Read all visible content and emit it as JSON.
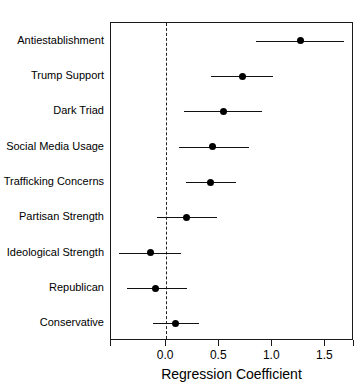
{
  "chart_data": {
    "type": "scatter",
    "subtype": "forest-plot",
    "title": "",
    "xlabel": "Regression Coefficient",
    "ylabel": "",
    "xlim": [
      -0.52,
      1.77
    ],
    "ylim": [
      0,
      9
    ],
    "grid": false,
    "legend": false,
    "reference_line": {
      "value": 0.0,
      "style": "dashed",
      "orientation": "vertical"
    },
    "xticks": [
      0.0,
      0.5,
      1.0,
      1.5
    ],
    "xticklabels": [
      "0.0",
      "0.5",
      "1.0",
      "1.5"
    ],
    "categories": [
      "Antiestablishment",
      "Trump Support",
      "Dark Triad",
      "Social Media Usage",
      "Trafficking Concerns",
      "Partisan Strength",
      "Ideological Strength",
      "Republican",
      "Conservative"
    ],
    "series": [
      {
        "name": "Regression Coefficient",
        "values": [
          1.27,
          0.72,
          0.54,
          0.44,
          0.42,
          0.19,
          -0.15,
          -0.1,
          0.09
        ],
        "ci_low": [
          0.85,
          0.42,
          0.17,
          0.12,
          0.19,
          -0.09,
          -0.44,
          -0.37,
          -0.12
        ],
        "ci_high": [
          1.68,
          1.01,
          0.9,
          0.78,
          0.66,
          0.48,
          0.14,
          0.2,
          0.31
        ],
        "point_color": "#000000",
        "line_color": "#111111"
      }
    ]
  },
  "colors": {
    "background": "#ffffff",
    "axis": "#1a1a1a",
    "point": "#000000",
    "interval": "#111111",
    "reference": "#222222",
    "text": "#000000"
  }
}
